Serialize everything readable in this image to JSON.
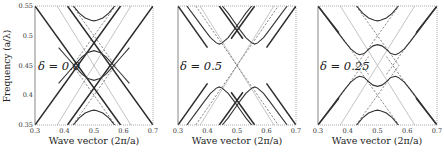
{
  "figure": {
    "ylabel": "Frequency (a/λ)",
    "xlabel": "Wave vector (2π/a)"
  },
  "chart_data": [
    {
      "type": "line",
      "panel_label": "δ = 0.0",
      "xlabel": "Wave vector (2π/a)",
      "ylabel": "Frequency (a/λ)",
      "xlim": [
        0.3,
        0.7
      ],
      "ylim": [
        0.35,
        0.55
      ],
      "xticks": [
        "0.3",
        "0.4",
        "0.5",
        "0.6",
        "0.7"
      ],
      "yticks": [
        "0.35",
        "0.4",
        "0.45",
        "0.5",
        "0.55"
      ],
      "grid": false,
      "series": [
        {
          "name": "light-line-1",
          "style": "light",
          "x": [
            0.375,
            0.625
          ],
          "y": [
            0.35,
            0.55
          ]
        },
        {
          "name": "light-line-2",
          "style": "light",
          "x": [
            0.375,
            0.625
          ],
          "y": [
            0.55,
            0.35
          ]
        },
        {
          "name": "outer-line-1",
          "style": "thick",
          "x": [
            0.3,
            0.59
          ],
          "y": [
            0.35,
            0.55
          ]
        },
        {
          "name": "outer-line-2",
          "style": "thick",
          "x": [
            0.3,
            0.59
          ],
          "y": [
            0.55,
            0.35
          ]
        },
        {
          "name": "outer-line-3",
          "style": "thick",
          "x": [
            0.41,
            0.7
          ],
          "y": [
            0.55,
            0.35
          ]
        },
        {
          "name": "outer-line-4",
          "style": "thick",
          "x": [
            0.41,
            0.7
          ],
          "y": [
            0.35,
            0.55
          ]
        },
        {
          "name": "dashed-upper-1",
          "style": "dashed",
          "x": [
            0.428,
            0.572
          ],
          "y": [
            0.55,
            0.45
          ]
        },
        {
          "name": "dashed-upper-2",
          "style": "dashed",
          "x": [
            0.428,
            0.572
          ],
          "y": [
            0.45,
            0.55
          ]
        },
        {
          "name": "dashed-lower-1",
          "style": "dashed",
          "x": [
            0.428,
            0.572
          ],
          "y": [
            0.35,
            0.45
          ]
        },
        {
          "name": "dashed-lower-2",
          "style": "dashed",
          "x": [
            0.428,
            0.572
          ],
          "y": [
            0.45,
            0.35
          ]
        },
        {
          "name": "band-top",
          "style": "solid",
          "x": [
            0.43,
            0.45,
            0.47,
            0.49,
            0.5,
            0.51,
            0.53,
            0.55,
            0.57
          ],
          "y": [
            0.55,
            0.538,
            0.53,
            0.526,
            0.525,
            0.526,
            0.53,
            0.538,
            0.55
          ]
        },
        {
          "name": "band-upper-mid",
          "style": "solid",
          "x": [
            0.38,
            0.41,
            0.44,
            0.46,
            0.48,
            0.5,
            0.52,
            0.54,
            0.56,
            0.59,
            0.62
          ],
          "y": [
            0.42,
            0.437,
            0.454,
            0.465,
            0.472,
            0.475,
            0.472,
            0.465,
            0.454,
            0.437,
            0.42
          ]
        },
        {
          "name": "band-lower-mid",
          "style": "solid",
          "x": [
            0.38,
            0.41,
            0.44,
            0.46,
            0.48,
            0.5,
            0.52,
            0.54,
            0.56,
            0.59,
            0.62
          ],
          "y": [
            0.48,
            0.463,
            0.446,
            0.435,
            0.428,
            0.425,
            0.428,
            0.435,
            0.446,
            0.463,
            0.48
          ]
        },
        {
          "name": "band-bottom",
          "style": "solid",
          "x": [
            0.43,
            0.45,
            0.47,
            0.49,
            0.5,
            0.51,
            0.53,
            0.55,
            0.57
          ],
          "y": [
            0.35,
            0.362,
            0.37,
            0.374,
            0.375,
            0.374,
            0.37,
            0.362,
            0.35
          ]
        }
      ]
    },
    {
      "type": "line",
      "panel_label": "δ = 0.5",
      "xlabel": "Wave vector (2π/a)",
      "xlim": [
        0.3,
        0.7
      ],
      "ylim": [
        0.35,
        0.55
      ],
      "xticks": [
        "0.3",
        "0.4",
        "0.5",
        "0.6",
        "0.7"
      ],
      "grid": false,
      "series": [
        {
          "name": "light-line-1",
          "style": "light",
          "x": [
            0.375,
            0.625
          ],
          "y": [
            0.35,
            0.55
          ]
        },
        {
          "name": "light-line-2",
          "style": "light",
          "x": [
            0.375,
            0.625
          ],
          "y": [
            0.55,
            0.35
          ]
        },
        {
          "name": "outer-line-1",
          "style": "thick",
          "x": [
            0.3,
            0.4
          ],
          "y": [
            0.55,
            0.48
          ]
        },
        {
          "name": "outer-line-2",
          "style": "thick",
          "x": [
            0.3,
            0.4
          ],
          "y": [
            0.35,
            0.42
          ]
        },
        {
          "name": "outer-line-3",
          "style": "thick",
          "x": [
            0.6,
            0.7
          ],
          "y": [
            0.48,
            0.55
          ]
        },
        {
          "name": "outer-line-4",
          "style": "thick",
          "x": [
            0.6,
            0.7
          ],
          "y": [
            0.42,
            0.35
          ]
        },
        {
          "name": "inner-line-1",
          "style": "thick",
          "x": [
            0.44,
            0.52
          ],
          "y": [
            0.35,
            0.405
          ]
        },
        {
          "name": "inner-line-2",
          "style": "thick",
          "x": [
            0.48,
            0.56
          ],
          "y": [
            0.405,
            0.35
          ]
        },
        {
          "name": "inner-line-3",
          "style": "thick",
          "x": [
            0.44,
            0.52
          ],
          "y": [
            0.55,
            0.495
          ]
        },
        {
          "name": "inner-line-4",
          "style": "thick",
          "x": [
            0.48,
            0.56
          ],
          "y": [
            0.495,
            0.55
          ]
        },
        {
          "name": "dashed-1",
          "style": "dashed",
          "x": [
            0.36,
            0.64
          ],
          "y": [
            0.55,
            0.35
          ]
        },
        {
          "name": "dashed-2",
          "style": "dashed",
          "x": [
            0.36,
            0.64
          ],
          "y": [
            0.35,
            0.55
          ]
        },
        {
          "name": "band-upper-left",
          "style": "solid",
          "x": [
            0.33,
            0.36,
            0.39,
            0.41,
            0.43,
            0.44,
            0.45,
            0.47,
            0.49,
            0.51,
            0.53,
            0.55
          ],
          "y": [
            0.55,
            0.53,
            0.51,
            0.497,
            0.488,
            0.486,
            0.488,
            0.497,
            0.51,
            0.524,
            0.538,
            0.55
          ]
        },
        {
          "name": "band-upper-right",
          "style": "solid",
          "x": [
            0.45,
            0.47,
            0.49,
            0.51,
            0.53,
            0.55,
            0.56,
            0.57,
            0.59,
            0.61,
            0.64,
            0.67
          ],
          "y": [
            0.55,
            0.538,
            0.524,
            0.51,
            0.497,
            0.488,
            0.486,
            0.488,
            0.497,
            0.51,
            0.53,
            0.55
          ]
        },
        {
          "name": "band-lower-left",
          "style": "solid",
          "x": [
            0.33,
            0.36,
            0.39,
            0.41,
            0.43,
            0.44,
            0.45,
            0.47,
            0.49,
            0.51,
            0.53,
            0.55
          ],
          "y": [
            0.35,
            0.37,
            0.39,
            0.403,
            0.412,
            0.414,
            0.412,
            0.403,
            0.39,
            0.376,
            0.362,
            0.35
          ]
        },
        {
          "name": "band-lower-right",
          "style": "solid",
          "x": [
            0.45,
            0.47,
            0.49,
            0.51,
            0.53,
            0.55,
            0.56,
            0.57,
            0.59,
            0.61,
            0.64,
            0.67
          ],
          "y": [
            0.35,
            0.362,
            0.376,
            0.39,
            0.403,
            0.412,
            0.414,
            0.412,
            0.403,
            0.39,
            0.37,
            0.35
          ]
        }
      ]
    },
    {
      "type": "line",
      "panel_label": "δ = 0.25",
      "xlabel": "Wave vector (2π/a)",
      "xlim": [
        0.3,
        0.7
      ],
      "ylim": [
        0.35,
        0.55
      ],
      "xticks": [
        "0.3",
        "0.4",
        "0.5",
        "0.6",
        "0.7"
      ],
      "grid": false,
      "series": [
        {
          "name": "light-line-1",
          "style": "light",
          "x": [
            0.375,
            0.625
          ],
          "y": [
            0.35,
            0.55
          ]
        },
        {
          "name": "light-line-2",
          "style": "light",
          "x": [
            0.375,
            0.625
          ],
          "y": [
            0.55,
            0.35
          ]
        },
        {
          "name": "outer-line-1",
          "style": "thick",
          "x": [
            0.3,
            0.37
          ],
          "y": [
            0.55,
            0.505
          ]
        },
        {
          "name": "outer-line-2",
          "style": "thick",
          "x": [
            0.3,
            0.37
          ],
          "y": [
            0.35,
            0.395
          ]
        },
        {
          "name": "outer-line-3",
          "style": "thick",
          "x": [
            0.63,
            0.7
          ],
          "y": [
            0.505,
            0.55
          ]
        },
        {
          "name": "outer-line-4",
          "style": "thick",
          "x": [
            0.63,
            0.7
          ],
          "y": [
            0.395,
            0.35
          ]
        },
        {
          "name": "dashed-upper-1",
          "style": "dashed",
          "x": [
            0.428,
            0.572
          ],
          "y": [
            0.55,
            0.45
          ]
        },
        {
          "name": "dashed-upper-2",
          "style": "dashed",
          "x": [
            0.428,
            0.572
          ],
          "y": [
            0.45,
            0.55
          ]
        },
        {
          "name": "dashed-lower-1",
          "style": "dashed",
          "x": [
            0.428,
            0.572
          ],
          "y": [
            0.35,
            0.45
          ]
        },
        {
          "name": "dashed-lower-2",
          "style": "dashed",
          "x": [
            0.428,
            0.572
          ],
          "y": [
            0.45,
            0.35
          ]
        },
        {
          "name": "dashed-outer-1",
          "style": "dashed",
          "x": [
            0.37,
            0.47
          ],
          "y": [
            0.505,
            0.435
          ]
        },
        {
          "name": "dashed-outer-2",
          "style": "dashed",
          "x": [
            0.53,
            0.63
          ],
          "y": [
            0.435,
            0.505
          ]
        },
        {
          "name": "dashed-outer-3",
          "style": "dashed",
          "x": [
            0.37,
            0.47
          ],
          "y": [
            0.395,
            0.465
          ]
        },
        {
          "name": "dashed-outer-4",
          "style": "dashed",
          "x": [
            0.53,
            0.63
          ],
          "y": [
            0.465,
            0.395
          ]
        },
        {
          "name": "band-top",
          "style": "solid",
          "x": [
            0.43,
            0.45,
            0.47,
            0.49,
            0.5,
            0.51,
            0.53,
            0.55,
            0.57
          ],
          "y": [
            0.55,
            0.538,
            0.53,
            0.526,
            0.525,
            0.526,
            0.53,
            0.538,
            0.55
          ]
        },
        {
          "name": "band-upper-wiggle",
          "style": "solid",
          "x": [
            0.3,
            0.33,
            0.36,
            0.39,
            0.41,
            0.43,
            0.44,
            0.455,
            0.47,
            0.485,
            0.5,
            0.515,
            0.53,
            0.545,
            0.56,
            0.57,
            0.59,
            0.61,
            0.64,
            0.67,
            0.7
          ],
          "y": [
            0.55,
            0.53,
            0.51,
            0.49,
            0.478,
            0.47,
            0.468,
            0.47,
            0.477,
            0.483,
            0.485,
            0.483,
            0.477,
            0.47,
            0.468,
            0.47,
            0.478,
            0.49,
            0.51,
            0.53,
            0.55
          ]
        },
        {
          "name": "band-lower-wiggle",
          "style": "solid",
          "x": [
            0.3,
            0.33,
            0.36,
            0.39,
            0.41,
            0.43,
            0.44,
            0.455,
            0.47,
            0.485,
            0.5,
            0.515,
            0.53,
            0.545,
            0.56,
            0.57,
            0.59,
            0.61,
            0.64,
            0.67,
            0.7
          ],
          "y": [
            0.35,
            0.37,
            0.39,
            0.41,
            0.422,
            0.43,
            0.432,
            0.43,
            0.423,
            0.417,
            0.415,
            0.417,
            0.423,
            0.43,
            0.432,
            0.43,
            0.422,
            0.41,
            0.39,
            0.37,
            0.35
          ]
        },
        {
          "name": "band-bottom",
          "style": "solid",
          "x": [
            0.43,
            0.45,
            0.47,
            0.49,
            0.5,
            0.51,
            0.53,
            0.55,
            0.57
          ],
          "y": [
            0.35,
            0.362,
            0.37,
            0.374,
            0.375,
            0.374,
            0.37,
            0.362,
            0.35
          ]
        }
      ]
    }
  ],
  "panels": [
    {
      "label": "δ = 0.0",
      "delta_symbol": "δ",
      "delta_value": "= 0.0"
    },
    {
      "label": "δ = 0.5",
      "delta_symbol": "δ",
      "delta_value": "= 0.5"
    },
    {
      "label": "δ = 0.25",
      "delta_symbol": "δ",
      "delta_value": "= 0.25"
    }
  ],
  "colors": {
    "thick": "#2a2a2a",
    "solid": "#333333",
    "dashed": "#555555",
    "light": "#b5b5b5",
    "frame": "#555555",
    "frame_top": "#888888"
  }
}
